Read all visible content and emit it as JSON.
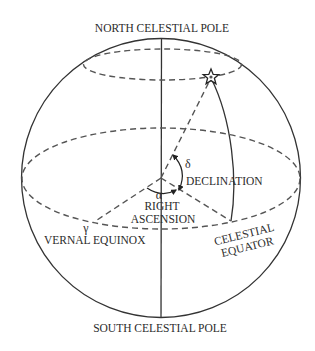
{
  "diagram": {
    "labels": {
      "north_pole": "NORTH CELESTIAL POLE",
      "south_pole": "SOUTH CELESTIAL POLE",
      "declination_symbol": "δ",
      "declination": "DECLINATION",
      "right_ascension_symbol": "α",
      "right_ascension_line1": "RIGHT",
      "right_ascension_line2": "ASCENSION",
      "vernal_equinox_symbol": "γ",
      "vernal_equinox": "VERNAL EQUINOX",
      "celestial_equator_line1": "CELESTIAL",
      "celestial_equator_line2": "EQUATOR"
    },
    "colors": {
      "line": "#333333",
      "dashed": "#555555",
      "text": "#2b2b2b",
      "background": "#ffffff"
    },
    "elements": [
      "celestial-sphere-outline",
      "polar-axis",
      "celestial-equator",
      "declination-parallel",
      "star",
      "hour-circle-arc",
      "star-direction-line",
      "vernal-equinox-direction-line",
      "meridian-foot-line",
      "right-ascension-angle-arc",
      "declination-angle-arc"
    ]
  }
}
